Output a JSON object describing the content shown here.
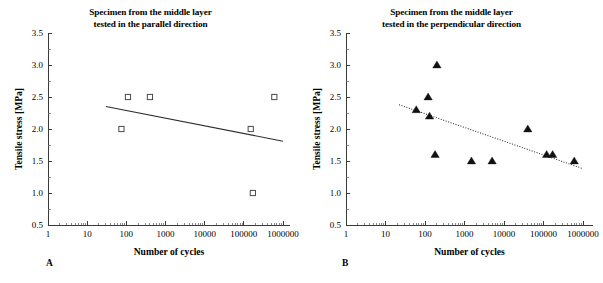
{
  "figure": {
    "width": 603,
    "height": 283,
    "background": "#ffffff",
    "ink_color": "#2e2e2e"
  },
  "panels": [
    {
      "id": "A",
      "label": "A",
      "title_line_1": "Specimen from the middle layer",
      "title_line_2": "tested in the parallel direction"
    },
    {
      "id": "B",
      "label": "B",
      "title_line_1": "Specimen from the middle layer",
      "title_line_2": "tested in the perpendicular direction"
    }
  ],
  "chart_data": [
    {
      "type": "scatter",
      "panel": "A",
      "title": "Specimen from the middle layer tested in the parallel direction",
      "xlabel": "Number of cycles",
      "ylabel": "Tensile stress [MPa]",
      "xscale": "log",
      "yscale": "linear",
      "xlim": [
        1,
        1000000
      ],
      "ylim": [
        0.5,
        3.5
      ],
      "xticks": [
        1,
        10,
        100,
        1000,
        10000,
        100000,
        1000000
      ],
      "xticklabels": [
        "1",
        "10",
        "100",
        "1000",
        "10000",
        "100000",
        "1000000"
      ],
      "yticks": [
        0.5,
        1.0,
        1.5,
        2.0,
        2.5,
        3.0,
        3.5
      ],
      "yticklabels": [
        "0.5",
        "1.0",
        "1.5",
        "2.0",
        "2.5",
        "3.0",
        "3.5"
      ],
      "grid": false,
      "legend": "none",
      "marker": "open-square",
      "series": [
        {
          "name": "Parallel direction specimens",
          "marker": "open-square",
          "points": [
            {
              "cycles": 75,
              "stress": 2.0
            },
            {
              "cycles": 110,
              "stress": 2.5
            },
            {
              "cycles": 400,
              "stress": 2.5
            },
            {
              "cycles": 150000,
              "stress": 2.0
            },
            {
              "cycles": 170000,
              "stress": 1.0
            },
            {
              "cycles": 600000,
              "stress": 2.5
            }
          ]
        }
      ],
      "trendline": {
        "style": "solid",
        "x_start": 30,
        "y_start": 2.35,
        "x_end": 1000000,
        "y_end": 1.81
      }
    },
    {
      "type": "scatter",
      "panel": "B",
      "title": "Specimen from the middle layer tested in the perpendicular direction",
      "xlabel": "Number of cycles",
      "ylabel": "Tensile stress [MPa]",
      "xscale": "log",
      "yscale": "linear",
      "xlim": [
        1,
        1000000
      ],
      "ylim": [
        0.5,
        3.5
      ],
      "xticks": [
        1,
        10,
        100,
        1000,
        10000,
        100000,
        1000000
      ],
      "xticklabels": [
        "1",
        "10",
        "100",
        "1000",
        "10000",
        "100000",
        "1000000"
      ],
      "yticks": [
        0.5,
        1.0,
        1.5,
        2.0,
        2.5,
        3.0,
        3.5
      ],
      "yticklabels": [
        "0.5",
        "1.0",
        "1.5",
        "2.0",
        "2.5",
        "3.0",
        "3.5"
      ],
      "grid": false,
      "legend": "none",
      "marker": "filled-triangle",
      "series": [
        {
          "name": "Perpendicular direction specimens",
          "marker": "filled-triangle",
          "points": [
            {
              "cycles": 60,
              "stress": 2.3
            },
            {
              "cycles": 120,
              "stress": 2.5
            },
            {
              "cycles": 130,
              "stress": 2.2
            },
            {
              "cycles": 200,
              "stress": 3.0
            },
            {
              "cycles": 180,
              "stress": 1.6
            },
            {
              "cycles": 1500,
              "stress": 1.5
            },
            {
              "cycles": 5000,
              "stress": 1.5
            },
            {
              "cycles": 40000,
              "stress": 2.0
            },
            {
              "cycles": 120000,
              "stress": 1.6
            },
            {
              "cycles": 170000,
              "stress": 1.6
            },
            {
              "cycles": 600000,
              "stress": 1.5
            }
          ]
        }
      ],
      "trendline": {
        "style": "dotted",
        "x_start": 22,
        "y_start": 2.38,
        "x_end": 1000000,
        "y_end": 1.38
      }
    }
  ]
}
